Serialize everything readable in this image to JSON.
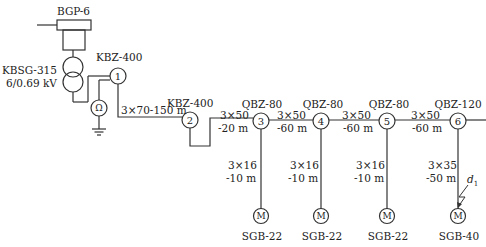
{
  "diagram": {
    "type": "mine power supply single-line diagram",
    "source": {
      "label": "BGP-6"
    },
    "transformer": {
      "model": "KBSG-315",
      "voltage": "6/0.69 kV"
    },
    "main_switch": {
      "label": "KBZ-400",
      "node": "1"
    },
    "leak_relay": {
      "symbol": "Ω"
    },
    "cable_1_2": "3×70-150 m",
    "switch_2": {
      "label": "KBZ-400",
      "node": "2"
    },
    "nodes": [
      {
        "node": "3",
        "switch": "QBZ-80",
        "feed_cable": [
          "3×50",
          "-20 m"
        ],
        "branch_cable": [
          "3×16",
          "-10 m"
        ],
        "motor": "SGB-22"
      },
      {
        "node": "4",
        "switch": "QBZ-80",
        "feed_cable": [
          "3×50",
          "-60 m"
        ],
        "branch_cable": [
          "3×16",
          "-10 m"
        ],
        "motor": "SGB-22"
      },
      {
        "node": "5",
        "switch": "QBZ-80",
        "feed_cable": [
          "3×50",
          "-60 m"
        ],
        "branch_cable": [
          "3×16",
          "-10 m"
        ],
        "motor": "SGB-22"
      },
      {
        "node": "6",
        "switch": "QBZ-120",
        "feed_cable": [
          "3×50",
          "-60 m"
        ],
        "branch_cable": [
          "3×35",
          "-50 m"
        ],
        "motor": "SGB-40"
      }
    ],
    "motor_symbol": "M",
    "fault_point": {
      "label": "d",
      "subscript": "1"
    }
  }
}
